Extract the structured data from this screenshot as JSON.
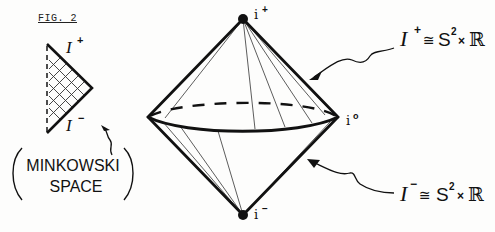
{
  "figure": {
    "label": "FIG. 2",
    "minkowski": {
      "scri_plus": "I",
      "scri_plus_sup": "+",
      "scri_minus": "I",
      "scri_minus_sup": "−",
      "caption_line1": "MINKOWSKI",
      "caption_line2": "SPACE",
      "paren_open": "(",
      "paren_close": ")"
    },
    "compactified": {
      "i_plus": "i",
      "i_plus_sup": "+",
      "i_zero": "i",
      "i_zero_sup": "o",
      "i_minus": "i",
      "i_minus_sup": "−"
    },
    "annotations": {
      "top": {
        "scri": "I",
        "sup": "+",
        "rel": "≅",
        "space": "S",
        "space_sup": "2",
        "times": "×",
        "reals": "ℝ"
      },
      "bottom": {
        "scri": "I",
        "sup": "−",
        "rel": "≅",
        "space": "S",
        "space_sup": "2",
        "times": "×",
        "reals": "ℝ"
      }
    }
  }
}
